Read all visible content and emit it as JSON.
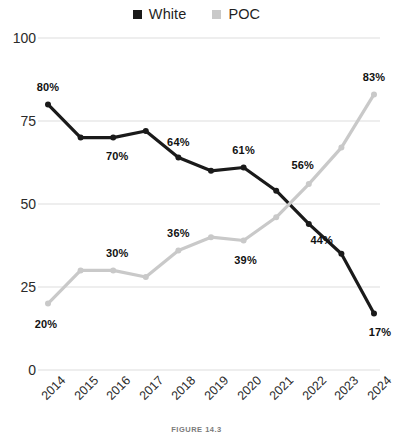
{
  "legend": {
    "entries": [
      {
        "label": "White",
        "color": "#1a1a1a",
        "marker": "square-marker"
      },
      {
        "label": "POC",
        "color": "#c9c9c9",
        "marker": "square-marker"
      }
    ]
  },
  "caption": "FIGURE 14.3",
  "axes": {
    "y_ticks": [
      "100",
      "75",
      "50",
      "25",
      "0"
    ],
    "x_ticks": [
      "2014",
      "2015",
      "2016",
      "2017",
      "2018",
      "2019",
      "2020",
      "2021",
      "2022",
      "2023",
      "2024"
    ]
  },
  "chart_data": {
    "type": "line",
    "title": "",
    "subtitle": "",
    "xlabel": "",
    "ylabel": "",
    "x": [
      "2014",
      "2015",
      "2016",
      "2017",
      "2018",
      "2019",
      "2020",
      "2021",
      "2022",
      "2023",
      "2024"
    ],
    "ylim": [
      0,
      100
    ],
    "yticks": [
      0,
      25,
      50,
      75,
      100
    ],
    "grid": "horizontal",
    "legend_position": "top-center",
    "series": [
      {
        "name": "White",
        "color": "#1a1a1a",
        "values": [
          80,
          70,
          70,
          72,
          64,
          60,
          61,
          54,
          44,
          35,
          17
        ],
        "point_labels": [
          {
            "x": "2014",
            "value": 80,
            "text": "80%"
          },
          {
            "x": "2016",
            "value": 70,
            "text": "70%"
          },
          {
            "x": "2018",
            "value": 64,
            "text": "64%"
          },
          {
            "x": "2020",
            "value": 61,
            "text": "61%"
          },
          {
            "x": "2022",
            "value": 44,
            "text": "44%"
          },
          {
            "x": "2024",
            "value": 17,
            "text": "17%"
          }
        ]
      },
      {
        "name": "POC",
        "color": "#c9c9c9",
        "values": [
          20,
          30,
          30,
          28,
          36,
          40,
          39,
          46,
          56,
          67,
          83
        ],
        "point_labels": [
          {
            "x": "2014",
            "value": 20,
            "text": "20%"
          },
          {
            "x": "2016",
            "value": 30,
            "text": "30%"
          },
          {
            "x": "2018",
            "value": 36,
            "text": "36%"
          },
          {
            "x": "2020",
            "value": 39,
            "text": "39%"
          },
          {
            "x": "2022",
            "value": 56,
            "text": "56%"
          },
          {
            "x": "2024",
            "value": 83,
            "text": "83%"
          }
        ]
      }
    ]
  }
}
